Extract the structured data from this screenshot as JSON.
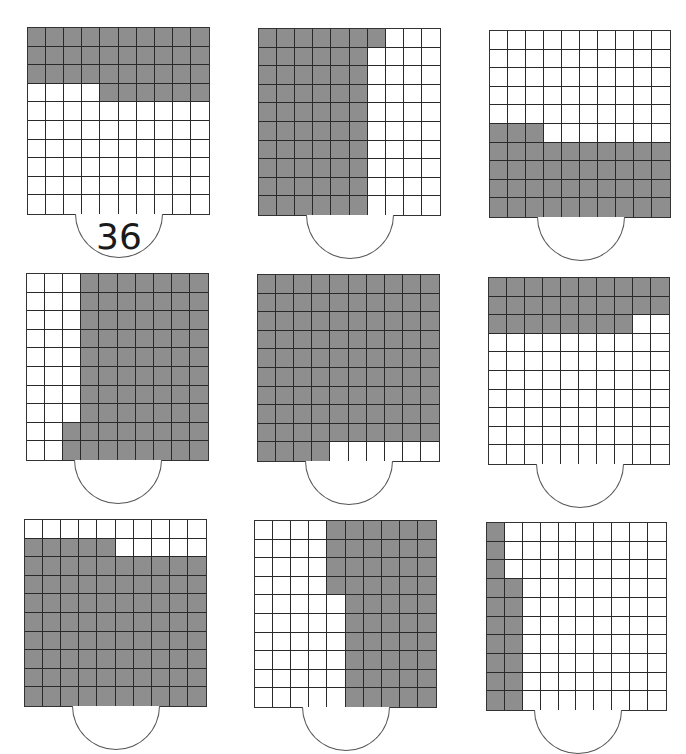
{
  "worksheet": {
    "grid_size": 10,
    "shade_color": "#8e8e8e",
    "line_color": "#2a2a2a",
    "grids": [
      {
        "id": 1,
        "shaded": 36,
        "pattern": "3 full rows from top + 6 cells right side of row 4",
        "answer": "36"
      },
      {
        "id": 2,
        "shaded": 61,
        "pattern": "6 full columns from left + top cell of column 7",
        "answer": ""
      },
      {
        "id": 3,
        "shaded": 43,
        "pattern": "4 full rows from bottom + 3 left cells of row 6",
        "answer": ""
      },
      {
        "id": 4,
        "shaded": 72,
        "pattern": "7 full columns from right + bottom 2 cells of column 3",
        "answer": ""
      },
      {
        "id": 5,
        "shaded": 94,
        "pattern": "9 full rows from top + 4 left cells of row 10",
        "answer": ""
      },
      {
        "id": 6,
        "shaded": 28,
        "pattern": "2 full rows from top + 8 left cells of row 3",
        "answer": ""
      },
      {
        "id": 7,
        "shaded": 85,
        "pattern": "8 full rows from bottom + 5 left cells of row 2",
        "answer": ""
      },
      {
        "id": 8,
        "shaded": 54,
        "pattern": "5 full columns from right + top 4 cells of column 5",
        "answer": ""
      },
      {
        "id": 9,
        "shaded": 17,
        "pattern": "1 full column from left + bottom 7 cells of column 2",
        "answer": ""
      }
    ]
  }
}
